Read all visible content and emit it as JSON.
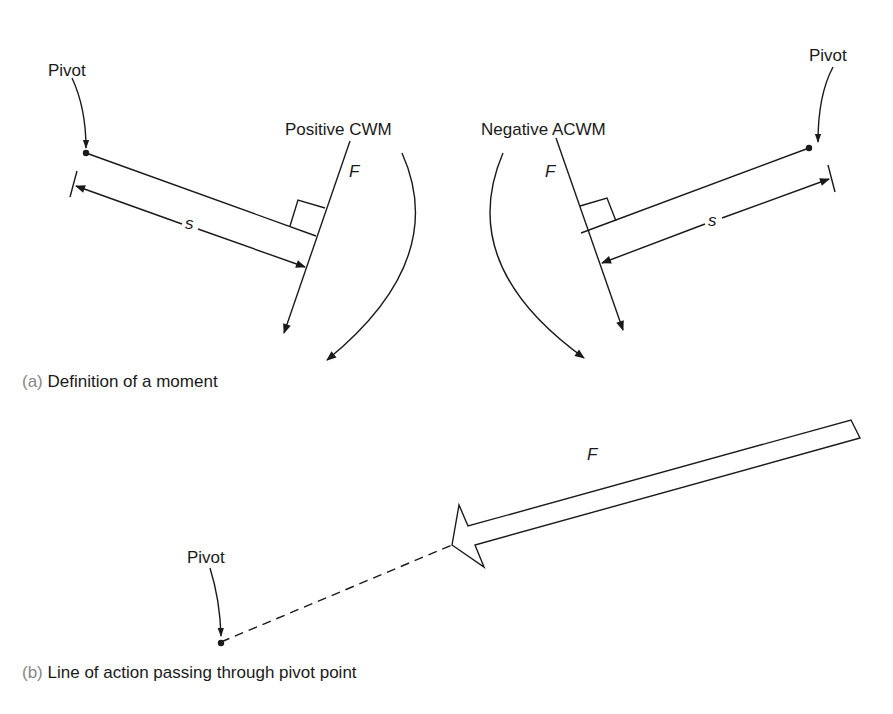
{
  "figure_a": {
    "caption_tag": "(a)",
    "caption_text": "Definition of a moment",
    "left": {
      "pivot_label": "Pivot",
      "moment_label": "Positive CWM",
      "force_label": "F",
      "distance_label": "s"
    },
    "right": {
      "pivot_label": "Pivot",
      "moment_label": "Negative ACWM",
      "force_label": "F",
      "distance_label": "s"
    }
  },
  "figure_b": {
    "caption_tag": "(b)",
    "caption_text": "Line of action passing through pivot point",
    "pivot_label": "Pivot",
    "force_label": "F"
  },
  "colors": {
    "ink": "#1a1a1a",
    "caption_tag": "#888888",
    "background": "#ffffff"
  }
}
